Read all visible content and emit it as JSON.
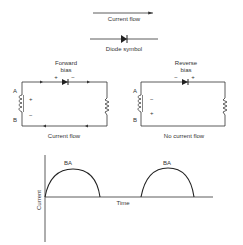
{
  "legend": {
    "current_flow_label": "Current flow",
    "diode_symbol_label": "Diode symbol"
  },
  "forward_circuit": {
    "title_line1": "Forward",
    "title_line2": "bias",
    "diode_plus": "+",
    "diode_minus": "−",
    "terminal_a": "A",
    "terminal_b": "B",
    "source_plus": "+",
    "source_minus": "−",
    "caption": "Current flow"
  },
  "reverse_circuit": {
    "title_line1": "Reverse",
    "title_line2": "bias",
    "diode_minus": "−",
    "diode_plus": "+",
    "terminal_a": "A",
    "terminal_b": "B",
    "source_minus": "−",
    "source_plus": "+",
    "caption": "No current flow"
  },
  "graph": {
    "y_label": "Current",
    "x_label": "Time",
    "pulse_labels": [
      "BA",
      "BA"
    ]
  },
  "colors": {
    "line": "#333333",
    "background": "#ffffff"
  }
}
